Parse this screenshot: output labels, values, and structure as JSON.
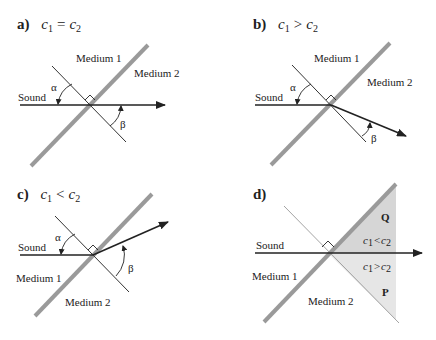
{
  "panels": [
    {
      "id": "a",
      "letter": "a)",
      "condition": {
        "lhs": "c",
        "lhs_sub": "1",
        "op": "=",
        "rhs": "c",
        "rhs_sub": "2"
      },
      "labels": {
        "medium1": "Medium 1",
        "medium2": "Medium 2",
        "sound": "Sound",
        "alpha": "α",
        "beta": "β"
      }
    },
    {
      "id": "b",
      "letter": "b)",
      "condition": {
        "lhs": "c",
        "lhs_sub": "1",
        "op": ">",
        "rhs": "c",
        "rhs_sub": "2"
      },
      "labels": {
        "medium1": "Medium 1",
        "medium2": "Medium 2",
        "sound": "Sound",
        "alpha": "α",
        "beta": "β"
      }
    },
    {
      "id": "c",
      "letter": "c)",
      "condition": {
        "lhs": "c",
        "lhs_sub": "1",
        "op": "<",
        "rhs": "c",
        "rhs_sub": "2"
      },
      "labels": {
        "medium1": "Medium 1",
        "medium2": "Medium 2",
        "sound": "Sound",
        "alpha": "α",
        "beta": "β"
      }
    },
    {
      "id": "d",
      "letter": "d)",
      "labels": {
        "medium1": "Medium 1",
        "medium2": "Medium 2",
        "sound": "Sound",
        "region_q": "Q",
        "region_p": "P",
        "q_cond": {
          "lhs": "c",
          "lhs_sub": "1",
          "op": "<",
          "rhs": "c",
          "rhs_sub": "2"
        },
        "p_cond": {
          "lhs": "c",
          "lhs_sub": "1",
          "op": ">",
          "rhs": "c",
          "rhs_sub": "2"
        }
      }
    }
  ],
  "colors": {
    "interface": "#9a9a9a",
    "ray": "#222222",
    "normal": "#333333",
    "shade_q": "#d6d6d6",
    "shade_p": "#e6e6e6"
  }
}
